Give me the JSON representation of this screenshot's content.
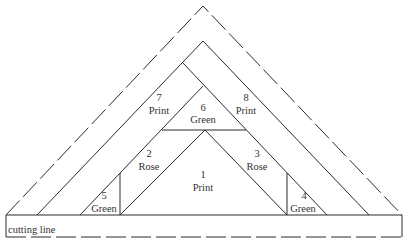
{
  "diagram": {
    "type": "quilt-piecing-template",
    "cutting_line_label": "cutting line",
    "pieces": [
      {
        "number": "1",
        "fabric": "Print"
      },
      {
        "number": "2",
        "fabric": "Rose"
      },
      {
        "number": "3",
        "fabric": "Rose"
      },
      {
        "number": "4",
        "fabric": "Green"
      },
      {
        "number": "5",
        "fabric": "Green"
      },
      {
        "number": "6",
        "fabric": "Green"
      },
      {
        "number": "7",
        "fabric": "Print"
      },
      {
        "number": "8",
        "fabric": "Print"
      }
    ],
    "colors": {
      "line": "#2a2a2a",
      "text": "#333333",
      "background": "#ffffff"
    }
  }
}
